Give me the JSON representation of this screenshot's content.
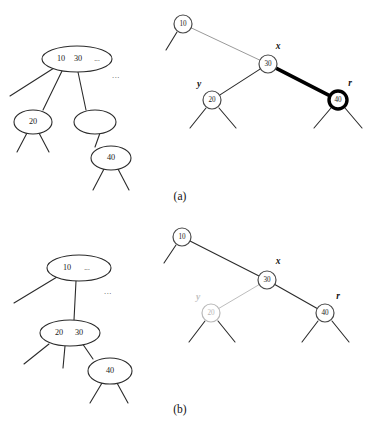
{
  "figure": {
    "background_color": "#ffffff",
    "width": 371,
    "height": 435,
    "colors": {
      "ink": "#2b2b2b",
      "node_stroke": "#4a4a4a",
      "highlight": "#000000",
      "faded": "#b9b9b9",
      "thin_gray_edge": "#9a9a9a"
    },
    "parts": [
      {
        "id": "part-a",
        "caption": "(a)",
        "caption_x": 180,
        "caption_y": 197,
        "left_tree": {
          "name": "btree-before",
          "ellipses": [
            {
              "id": "a-l-root",
              "cx": 77,
              "cy": 59,
              "rx": 35,
              "ry": 13,
              "keys": [
                {
                  "text": "10",
                  "dx": -16
                },
                {
                  "text": "30",
                  "dx": 1
                },
                {
                  "text": "...",
                  "dx": 20
                }
              ]
            },
            {
              "id": "a-l-c1",
              "cx": 33,
              "cy": 122,
              "rx": 19,
              "ry": 12,
              "keys": [
                {
                  "text": "20",
                  "dx": 0
                }
              ]
            },
            {
              "id": "a-l-c2",
              "cx": 95,
              "cy": 122,
              "rx": 21,
              "ry": 12,
              "keys": []
            },
            {
              "id": "a-l-c3",
              "cx": 111,
              "cy": 158,
              "rx": 20,
              "ry": 12,
              "keys": [
                {
                  "text": "40",
                  "dx": 0
                }
              ]
            }
          ],
          "extra_ellipsis": {
            "text": "...",
            "x": 116,
            "y": 76
          }
        },
        "right_tree": {
          "name": "rbtree-before",
          "nodes": [
            {
              "id": "a-r-10",
              "label": "10",
              "cx": 183,
              "cy": 24,
              "r": 9,
              "style": "normal",
              "var": null
            },
            {
              "id": "a-r-30",
              "label": "30",
              "cx": 268,
              "cy": 64,
              "r": 9,
              "style": "normal",
              "var": "x",
              "var_x": 278,
              "var_y": 47
            },
            {
              "id": "a-r-20",
              "label": "20",
              "cx": 212,
              "cy": 100,
              "r": 9,
              "style": "normal",
              "var": "y",
              "var_x": 199,
              "var_y": 85
            },
            {
              "id": "a-r-40",
              "label": "40",
              "cx": 338,
              "cy": 100,
              "r": 9,
              "style": "bold-ring",
              "var": "r",
              "var_x": 350,
              "var_y": 84
            }
          ],
          "edges": [
            {
              "from": "a-r-10",
              "to": "a-r-30",
              "style": "thin-gray"
            },
            {
              "from": "a-r-30",
              "to": "a-r-20",
              "style": "normal"
            },
            {
              "from": "a-r-30",
              "to": "a-r-40",
              "style": "bold"
            }
          ]
        }
      },
      {
        "id": "part-b",
        "caption": "(b)",
        "caption_x": 180,
        "caption_y": 410,
        "left_tree": {
          "name": "btree-after",
          "ellipses": [
            {
              "id": "b-l-root",
              "cx": 79,
              "cy": 268,
              "rx": 32,
              "ry": 13,
              "keys": [
                {
                  "text": "10",
                  "dx": -12
                },
                {
                  "text": "...",
                  "dx": 8
                }
              ]
            },
            {
              "id": "b-l-c1",
              "cx": 70,
              "cy": 333,
              "rx": 30,
              "ry": 13,
              "keys": [
                {
                  "text": "20",
                  "dx": -11
                },
                {
                  "text": "30",
                  "dx": 9
                }
              ]
            },
            {
              "id": "b-l-c2",
              "cx": 110,
              "cy": 371,
              "rx": 22,
              "ry": 13,
              "keys": [
                {
                  "text": "40",
                  "dx": 0
                }
              ]
            }
          ],
          "extra_ellipsis": {
            "text": "...",
            "x": 108,
            "y": 292
          }
        },
        "right_tree": {
          "name": "rbtree-after",
          "nodes": [
            {
              "id": "b-r-10",
              "label": "10",
              "cx": 182,
              "cy": 237,
              "r": 9,
              "style": "normal",
              "var": null
            },
            {
              "id": "b-r-30",
              "label": "30",
              "cx": 267,
              "cy": 280,
              "r": 9,
              "style": "normal",
              "var": "x",
              "var_x": 278,
              "var_y": 262
            },
            {
              "id": "b-r-20",
              "label": "20",
              "cx": 211,
              "cy": 313,
              "r": 9,
              "style": "faded",
              "var": "y",
              "var_x": 198,
              "var_y": 298
            },
            {
              "id": "b-r-40",
              "label": "40",
              "cx": 325,
              "cy": 313,
              "r": 9,
              "style": "normal",
              "var": "r",
              "var_x": 338,
              "var_y": 297
            }
          ],
          "edges": [
            {
              "from": "b-r-10",
              "to": "b-r-30",
              "style": "normal"
            },
            {
              "from": "b-r-30",
              "to": "b-r-20",
              "style": "faded"
            },
            {
              "from": "b-r-30",
              "to": "b-r-40",
              "style": "normal"
            }
          ]
        }
      }
    ],
    "dangling_edges": [
      {
        "part": "a",
        "x1": 10,
        "y1": 96,
        "x2": 54,
        "y2": 68
      },
      {
        "part": "a",
        "x1": 43,
        "y1": 110,
        "x2": 62,
        "y2": 71
      },
      {
        "part": "a",
        "x1": 86,
        "y1": 110,
        "x2": 78,
        "y2": 72
      },
      {
        "part": "a",
        "x1": 17,
        "y1": 152,
        "x2": 27,
        "y2": 133
      },
      {
        "part": "a",
        "x1": 49,
        "y1": 152,
        "x2": 39,
        "y2": 133
      },
      {
        "part": "a",
        "x1": 95,
        "y1": 147,
        "x2": 100,
        "y2": 133
      },
      {
        "part": "a",
        "x1": 93,
        "y1": 190,
        "x2": 104,
        "y2": 169
      },
      {
        "part": "a",
        "x1": 129,
        "y1": 190,
        "x2": 118,
        "y2": 169
      },
      {
        "part": "a",
        "x1": 166,
        "y1": 50,
        "x2": 177,
        "y2": 32
      },
      {
        "part": "a",
        "x1": 190,
        "y1": 128,
        "x2": 206,
        "y2": 108
      },
      {
        "part": "a",
        "x1": 236,
        "y1": 128,
        "x2": 219,
        "y2": 108
      },
      {
        "part": "a",
        "x1": 314,
        "y1": 128,
        "x2": 331,
        "y2": 108
      },
      {
        "part": "a",
        "x1": 362,
        "y1": 128,
        "x2": 345,
        "y2": 108
      },
      {
        "part": "b",
        "x1": 14,
        "y1": 303,
        "x2": 57,
        "y2": 277
      },
      {
        "part": "b",
        "x1": 74,
        "y1": 320,
        "x2": 76,
        "y2": 281
      },
      {
        "part": "b",
        "x1": 24,
        "y1": 364,
        "x2": 49,
        "y2": 344
      },
      {
        "part": "b",
        "x1": 63,
        "y1": 368,
        "x2": 65,
        "y2": 346
      },
      {
        "part": "b",
        "x1": 93,
        "y1": 359,
        "x2": 82,
        "y2": 343
      },
      {
        "part": "b",
        "x1": 90,
        "y1": 403,
        "x2": 102,
        "y2": 383
      },
      {
        "part": "b",
        "x1": 128,
        "y1": 403,
        "x2": 117,
        "y2": 383
      },
      {
        "part": "b",
        "x1": 164,
        "y1": 263,
        "x2": 176,
        "y2": 245
      },
      {
        "part": "b",
        "x1": 189,
        "y1": 342,
        "x2": 205,
        "y2": 321
      },
      {
        "part": "b",
        "x1": 235,
        "y1": 342,
        "x2": 218,
        "y2": 321
      },
      {
        "part": "b",
        "x1": 302,
        "y1": 342,
        "x2": 318,
        "y2": 321
      },
      {
        "part": "b",
        "x1": 349,
        "y1": 342,
        "x2": 332,
        "y2": 321
      }
    ]
  }
}
